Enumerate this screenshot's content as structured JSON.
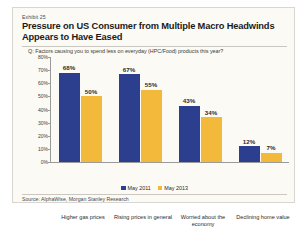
{
  "exhibit": {
    "label": "Exhibit 25",
    "title": "Pressure on US Consumer from Multiple Macro Headwinds Appears to Have Eased",
    "question": "Q: Factors causing you to spend less on everyday (HPC/Food) products this year?",
    "source": "Source: AlphaWise, Morgan Stanley Research"
  },
  "colors": {
    "series_2011": "#2c3f8f",
    "series_2013": "#f2b93b",
    "card_background": "#fbfaf5",
    "axis": "#9a9a9a"
  },
  "chart_data": {
    "type": "bar",
    "title": "Pressure on US Consumer from Multiple Macro Headwinds Appears to Have Eased",
    "subtitle": "Q: Factors causing you to spend less on everyday (HPC/Food) products this year?",
    "xlabel": "",
    "ylabel": "",
    "ylim": [
      0,
      80
    ],
    "ytick_labels": [
      "80%",
      "70%",
      "60%",
      "50%",
      "40%",
      "30%",
      "20%",
      "10%",
      "0%"
    ],
    "ytick_values": [
      80,
      70,
      60,
      50,
      40,
      30,
      20,
      10,
      0
    ],
    "grid": false,
    "legend_position": "bottom",
    "categories": [
      "Higher gas prices",
      "Rising prices in general",
      "Worried about the economy",
      "Declining home value"
    ],
    "series": [
      {
        "name": "May 2011",
        "color": "#2c3f8f",
        "values": [
          68,
          67,
          43,
          12
        ],
        "labels": [
          "68%",
          "67%",
          "43%",
          "12%"
        ]
      },
      {
        "name": "May 2013",
        "color": "#f2b93b",
        "values": [
          50,
          55,
          34,
          7
        ],
        "labels": [
          "50%",
          "55%",
          "34%",
          "7%"
        ]
      }
    ]
  }
}
